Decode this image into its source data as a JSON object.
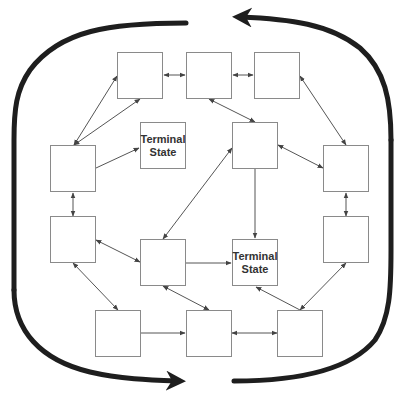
{
  "diagram": {
    "type": "state-transition",
    "colors": {
      "box_border": "#8a8a8a",
      "edge": "#555555",
      "loop": "#1e1e1e",
      "text": "#333333"
    },
    "states": [
      {
        "id": "s1",
        "label": "",
        "x": 117,
        "y": 52
      },
      {
        "id": "s2",
        "label": "",
        "x": 186,
        "y": 52
      },
      {
        "id": "s3",
        "label": "",
        "x": 254,
        "y": 52
      },
      {
        "id": "s4",
        "label": "",
        "x": 50,
        "y": 145
      },
      {
        "id": "t1",
        "label": "Terminal\nState",
        "x": 140,
        "y": 122
      },
      {
        "id": "s5",
        "label": "",
        "x": 232,
        "y": 122
      },
      {
        "id": "s6",
        "label": "",
        "x": 323,
        "y": 145
      },
      {
        "id": "s7",
        "label": "",
        "x": 50,
        "y": 216
      },
      {
        "id": "s8",
        "label": "",
        "x": 140,
        "y": 239
      },
      {
        "id": "t2",
        "label": "Terminal\nState",
        "x": 232,
        "y": 239
      },
      {
        "id": "s9",
        "label": "",
        "x": 323,
        "y": 216
      },
      {
        "id": "s10",
        "label": "",
        "x": 95,
        "y": 310
      },
      {
        "id": "s11",
        "label": "",
        "x": 186,
        "y": 310
      },
      {
        "id": "s12",
        "label": "",
        "x": 277,
        "y": 310
      }
    ],
    "edges": [
      {
        "from": "s1",
        "to": "s2",
        "bidirectional": true
      },
      {
        "from": "s2",
        "to": "s3",
        "bidirectional": true
      },
      {
        "from": "s4",
        "to": "s1",
        "bidirectional": true,
        "note": "to left side"
      },
      {
        "from": "s4",
        "to": "s1",
        "bidirectional": true,
        "note": "to bottom"
      },
      {
        "from": "s4",
        "to": "t1",
        "bidirectional": false
      },
      {
        "from": "s2",
        "to": "s5",
        "bidirectional": true
      },
      {
        "from": "s3",
        "to": "s6",
        "bidirectional": true
      },
      {
        "from": "s5",
        "to": "s6",
        "bidirectional": true
      },
      {
        "from": "s4",
        "to": "s7",
        "bidirectional": true
      },
      {
        "from": "s6",
        "to": "s9",
        "bidirectional": true
      },
      {
        "from": "s5",
        "to": "s8",
        "bidirectional": true
      },
      {
        "from": "s5",
        "to": "t2",
        "bidirectional": false
      },
      {
        "from": "s7",
        "to": "s8",
        "bidirectional": true
      },
      {
        "from": "s8",
        "to": "t2",
        "bidirectional": false
      },
      {
        "from": "s7",
        "to": "s10",
        "bidirectional": true
      },
      {
        "from": "s8",
        "to": "s11",
        "bidirectional": true
      },
      {
        "from": "s10",
        "to": "s11",
        "bidirectional": false
      },
      {
        "from": "s11",
        "to": "s12",
        "bidirectional": true
      },
      {
        "from": "s12",
        "to": "t2",
        "bidirectional": false
      },
      {
        "from": "s9",
        "to": "s12",
        "bidirectional": true
      }
    ],
    "outer_loop": {
      "description": "Thick rounded loop with two arrows (top pointing left, bottom pointing right)"
    }
  }
}
